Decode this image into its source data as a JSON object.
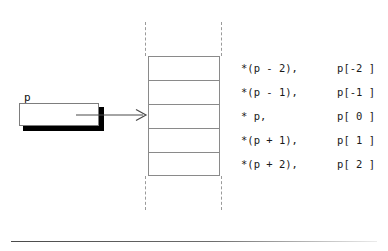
{
  "figure": {
    "pointer": {
      "label": "p",
      "box_value": ""
    },
    "memory": {
      "cell_count": 5,
      "pointed_cell_index": 2,
      "cells": [
        "",
        "",
        "",
        "",
        ""
      ]
    },
    "rows": [
      {
        "deref": "*(p - 2),",
        "index": "p[-2 ]"
      },
      {
        "deref": "*(p - 1),",
        "index": "p[-1 ]"
      },
      {
        "deref": "* p,",
        "index": "p[ 0 ]"
      },
      {
        "deref": "*(p + 1),",
        "index": "p[ 1 ]"
      },
      {
        "deref": "*(p + 2),",
        "index": "p[ 2 ]"
      }
    ],
    "colors": {
      "background": "#ffffff",
      "cell_border": "#8a8a8a",
      "dashed_line": "#9a9a9a",
      "box_border": "#7d7d7d",
      "box_shadow": "#000000",
      "text": "#1a1a1a",
      "arrow": "#4a4a4a",
      "rule": "#4a4a4a"
    }
  }
}
